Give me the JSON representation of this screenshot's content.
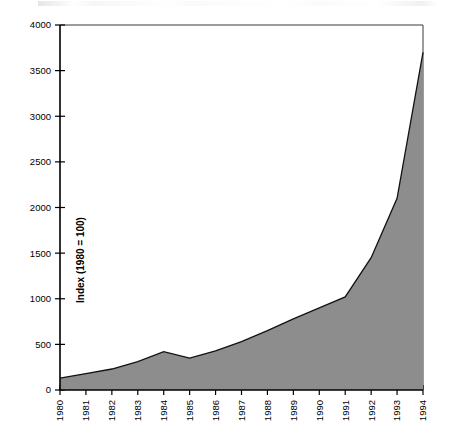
{
  "chart_data": {
    "type": "area",
    "title": "",
    "xlabel": "",
    "ylabel": "Index (1980 = 100)",
    "categories": [
      "1980",
      "1981",
      "1982",
      "1983",
      "1984",
      "1985",
      "1986",
      "1987",
      "1988",
      "1989",
      "1990",
      "1991",
      "1992",
      "1993",
      "1994"
    ],
    "values": [
      130,
      180,
      230,
      310,
      420,
      350,
      430,
      530,
      650,
      780,
      900,
      1020,
      1450,
      2100,
      3700
    ],
    "x": [
      1980,
      1981,
      1982,
      1983,
      1984,
      1985,
      1986,
      1987,
      1988,
      1989,
      1990,
      1991,
      1992,
      1993,
      1994
    ],
    "ylim": [
      0,
      4000
    ],
    "xlim": [
      1980,
      1994
    ],
    "yticks": [
      0,
      500,
      1000,
      1500,
      2000,
      2500,
      3000,
      3500,
      4000
    ],
    "ytick_labels": [
      "0",
      "500",
      "1000",
      "1500",
      "2000",
      "2500",
      "3000",
      "3500",
      "4000"
    ],
    "xtick_labels": [
      "1980",
      "1981",
      "1982",
      "1983",
      "1984",
      "1985",
      "1986",
      "1987",
      "1988",
      "1989",
      "1990",
      "1991",
      "1992",
      "1993",
      "1994"
    ],
    "grid": false,
    "legend": null,
    "legend_position": "none",
    "series": [
      {
        "name": "Index (1980 = 100)",
        "values": [
          130,
          180,
          230,
          310,
          420,
          350,
          430,
          530,
          650,
          780,
          900,
          1020,
          1450,
          2100,
          3700
        ]
      }
    ],
    "annotations": [],
    "colors": {
      "area_fill": "#8d8d8d",
      "area_stroke": "#111111",
      "axis": "#000000",
      "background": "#ffffff"
    },
    "xtick_label_rotation": -90
  },
  "axes": {
    "y_axis_title": "Index (1980 = 100)"
  }
}
